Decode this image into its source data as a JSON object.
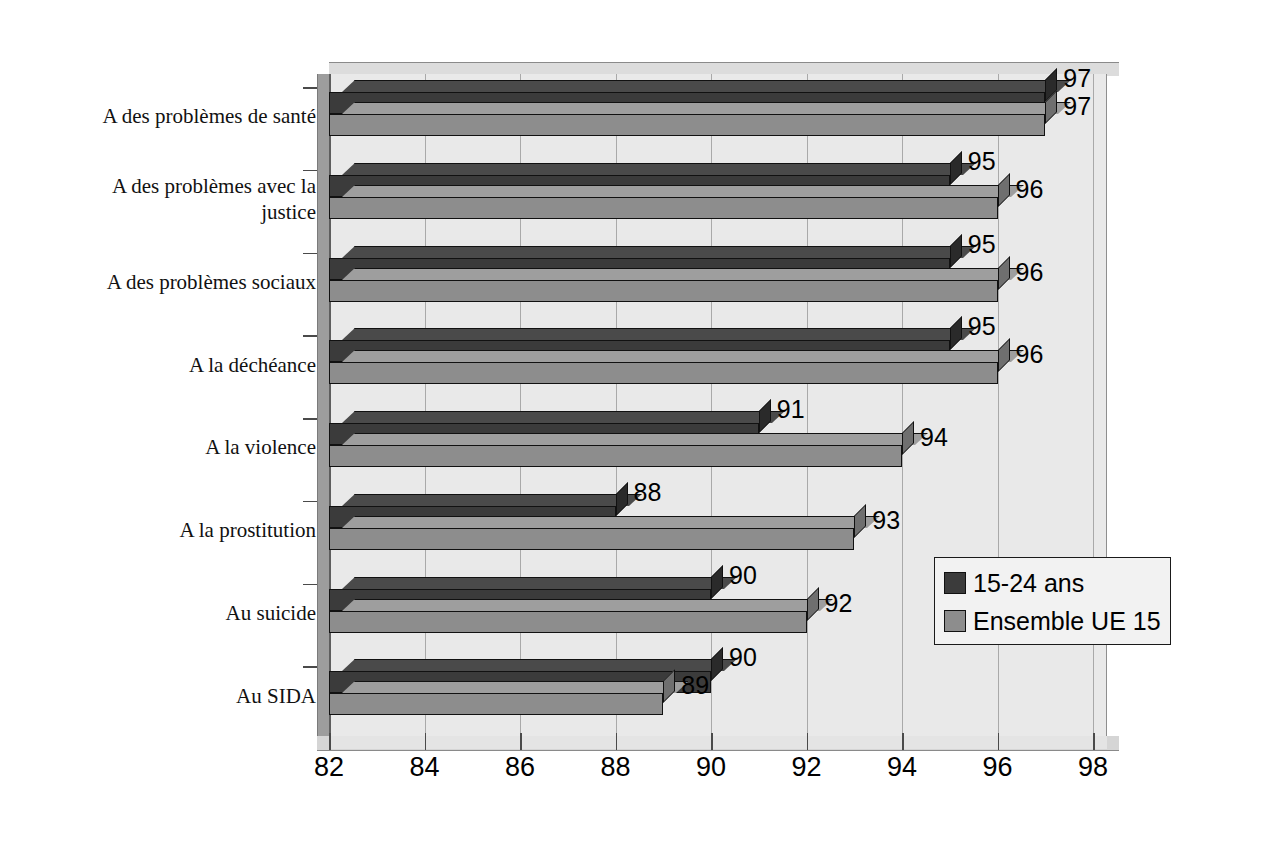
{
  "chart_data": {
    "type": "bar",
    "orientation": "horizontal",
    "title": "",
    "subtitle": "",
    "xlabel": "",
    "ylabel": "",
    "xlim": [
      82,
      98
    ],
    "xticks": [
      82,
      84,
      86,
      88,
      90,
      92,
      94,
      96,
      98
    ],
    "xtick_labels": [
      "82",
      "84",
      "86",
      "88",
      "90",
      "92",
      "94",
      "96",
      "98"
    ],
    "grid": true,
    "grid_axis": "x",
    "legend_position": "middle-right",
    "categories": [
      "A des problèmes de santé",
      "A des problèmes avec la justice",
      "A des problèmes sociaux",
      "A la déchéance",
      "A la violence",
      "A la prostitution",
      "Au suicide",
      "Au SIDA"
    ],
    "category_lines": [
      [
        "A des problèmes de santé"
      ],
      [
        "A des problèmes avec la",
        "justice"
      ],
      [
        "A des problèmes sociaux"
      ],
      [
        "A la déchéance"
      ],
      [
        "A la violence"
      ],
      [
        "A la prostitution"
      ],
      [
        "Au suicide"
      ],
      [
        "Au SIDA"
      ]
    ],
    "series": [
      {
        "name": "15-24 ans",
        "color": "#3b3b3b",
        "values": [
          97,
          95,
          95,
          95,
          91,
          88,
          90,
          90
        ],
        "labels": [
          "97",
          "95",
          "95",
          "95",
          "91",
          "88",
          "90",
          "90"
        ]
      },
      {
        "name": "Ensemble UE 15",
        "color": "#8d8d8d",
        "values": [
          97,
          96,
          96,
          96,
          94,
          93,
          92,
          89
        ],
        "labels": [
          "97",
          "96",
          "96",
          "96",
          "94",
          "93",
          "92",
          "89"
        ]
      }
    ]
  },
  "legend": {
    "items": [
      {
        "label": "15-24 ans",
        "color": "#3b3b3b"
      },
      {
        "label": "Ensemble UE 15",
        "color": "#8d8d8d"
      }
    ]
  },
  "axis": {
    "x_tick_labels": [
      "82",
      "84",
      "86",
      "88",
      "90",
      "92",
      "94",
      "96",
      "98"
    ]
  },
  "colors": {
    "series_1": "#3b3b3b",
    "series_2": "#8d8d8d",
    "plot_background": "#e9e9e9",
    "page_background": "#ffffff",
    "gridline": "#a9a9a9",
    "axis": "#4a4a4a"
  }
}
